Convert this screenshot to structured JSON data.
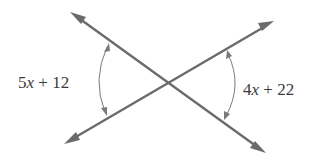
{
  "figure": {
    "colors": {
      "line": "#6b6b6b",
      "arc": "#7a7a7a",
      "text": "#3a3a3a",
      "background": "#ffffff"
    },
    "angles": [
      {
        "position": "left",
        "coefficient": "5",
        "variable": "x",
        "operator": " + ",
        "constant": "12",
        "expression": "5x + 12"
      },
      {
        "position": "right",
        "coefficient": "4",
        "variable": "x",
        "operator": " + ",
        "constant": "22",
        "expression": "4x + 22"
      }
    ],
    "relationship": "vertical angles"
  }
}
